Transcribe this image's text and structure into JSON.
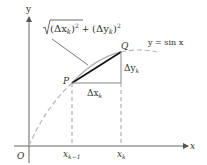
{
  "diagram": {
    "type": "arc-length-approximation",
    "axes": {
      "x_label": "x",
      "y_label": "y",
      "origin_label": "O"
    },
    "curve": {
      "label": "y = sin x",
      "color": "#b0b0b0"
    },
    "points": {
      "P": "P",
      "Q": "Q"
    },
    "segment": {
      "formula": "√((Δx_k)² + (Δy_k)²)",
      "formula_parts": {
        "radical": "√",
        "open1": "(",
        "dx": "Δx",
        "dx_sub": "k",
        "close1": ")",
        "sq1": "2",
        "plus": " + ",
        "open2": "(",
        "dy": "Δy",
        "dy_sub": "k",
        "close2": ")",
        "sq2": "2"
      },
      "color": "#111111"
    },
    "deltas": {
      "dx": "Δx",
      "dx_sub": "k",
      "dy": "Δy",
      "dy_sub": "k"
    },
    "ticks": {
      "left_main": "x",
      "left_sub": "k−1",
      "right_main": "x",
      "right_sub": "k"
    }
  }
}
